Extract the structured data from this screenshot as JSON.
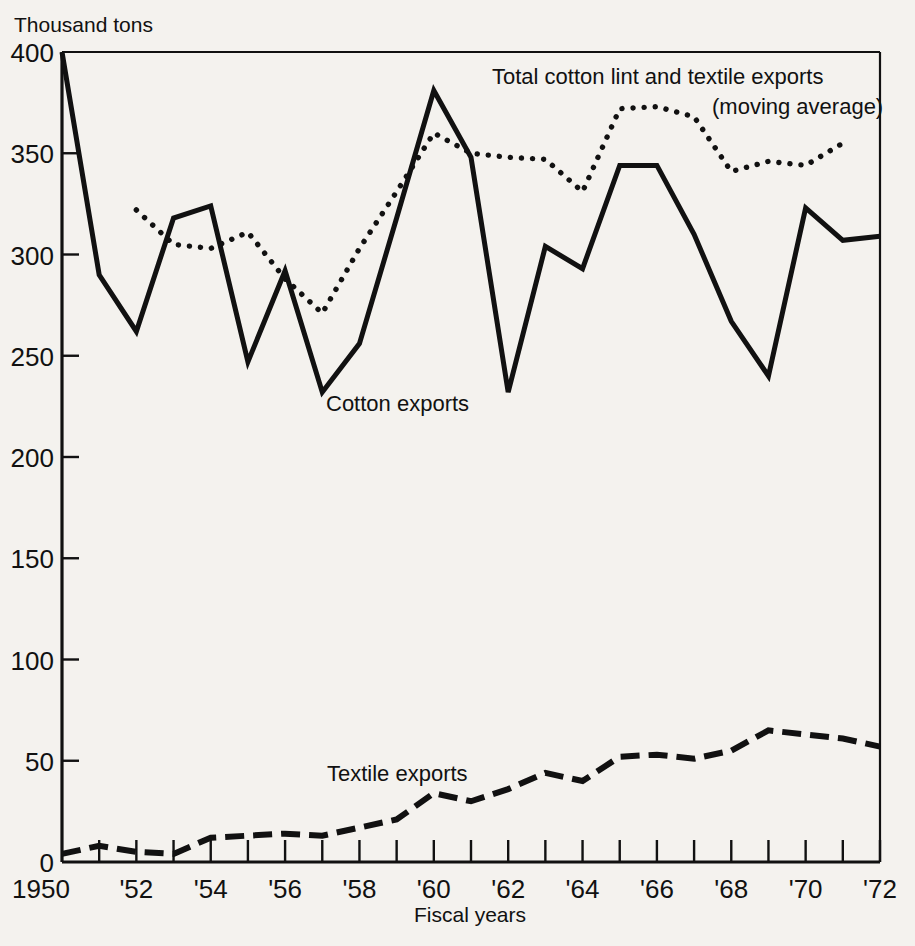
{
  "chart_data": {
    "type": "line",
    "title": "",
    "xlabel": "Fiscal years",
    "ylabel": "Thousand tons",
    "ylim": [
      0,
      400
    ],
    "xlim": [
      1950,
      1972
    ],
    "grid": false,
    "legend_position": "inline-annotations",
    "y_ticks": [
      0,
      50,
      100,
      150,
      200,
      250,
      300,
      350,
      400
    ],
    "y_tick_labels": [
      "0",
      "50",
      "100",
      "150",
      "200",
      "250",
      "300",
      "350",
      "400"
    ],
    "x_ticks": [
      1950,
      1951,
      1952,
      1953,
      1954,
      1955,
      1956,
      1957,
      1958,
      1959,
      1960,
      1961,
      1962,
      1963,
      1964,
      1965,
      1966,
      1967,
      1968,
      1969,
      1970,
      1971,
      1972
    ],
    "x_tick_labels": [
      "1950",
      "",
      "'52",
      "",
      "'54",
      "",
      "'56",
      "",
      "'58",
      "",
      "'60",
      "",
      "'62",
      "",
      "'64",
      "",
      "'66",
      "",
      "'68",
      "",
      "'70",
      "",
      "'72"
    ],
    "x": [
      1950,
      1951,
      1952,
      1953,
      1954,
      1955,
      1956,
      1957,
      1958,
      1959,
      1960,
      1961,
      1962,
      1963,
      1964,
      1965,
      1966,
      1967,
      1968,
      1969,
      1970,
      1971,
      1972
    ],
    "series": [
      {
        "name": "Cotton exports",
        "style": "solid",
        "values": [
          400,
          290,
          262,
          318,
          324,
          247,
          292,
          232,
          256,
          318,
          381,
          348,
          232,
          304,
          293,
          344,
          344,
          310,
          267,
          240,
          323,
          307,
          309
        ]
      },
      {
        "name": "Total cotton lint and textile exports (moving average)",
        "style": "dotted",
        "x": [
          1952,
          1953,
          1954,
          1955,
          1956,
          1957,
          1958,
          1959,
          1960,
          1961,
          1962,
          1963,
          1964,
          1965,
          1966,
          1967,
          1968,
          1969,
          1970,
          1971
        ],
        "values": [
          322,
          305,
          303,
          311,
          288,
          271,
          303,
          331,
          360,
          350,
          348,
          347,
          331,
          372,
          373,
          368,
          341,
          346,
          344,
          355
        ]
      },
      {
        "name": "Textile exports",
        "style": "dashed",
        "values": [
          4,
          8,
          5,
          4,
          12,
          13,
          14,
          13,
          17,
          21,
          34,
          30,
          36,
          44,
          40,
          52,
          53,
          51,
          55,
          65,
          63,
          61,
          57
        ]
      }
    ],
    "annotations": [
      {
        "id": "total-annotation",
        "lines": [
          "Total cotton lint and textile exports",
          "(moving average)"
        ],
        "target_series": "Total cotton lint and textile exports (moving average)"
      },
      {
        "id": "cotton-annotation",
        "lines": [
          "Cotton exports"
        ],
        "target_series": "Cotton exports"
      },
      {
        "id": "textile-annotation",
        "lines": [
          "Textile exports"
        ],
        "target_series": "Textile exports"
      }
    ],
    "colors": {
      "ink": "#111111",
      "paper": "#f4f2ee"
    }
  },
  "labels": {
    "y_axis_title": "Thousand tons",
    "x_axis_title": "Fiscal years",
    "annotation_total_line1": "Total cotton lint and textile exports",
    "annotation_total_line2": "(moving average)",
    "annotation_cotton": "Cotton exports",
    "annotation_textile": "Textile exports",
    "y_400": "400",
    "y_350": "350",
    "y_300": "300",
    "y_250": "250",
    "y_200": "200",
    "y_150": "150",
    "y_100": "100",
    "y_50": "50",
    "y_0": "0",
    "x_1950": "1950",
    "x_1952": "'52",
    "x_1954": "'54",
    "x_1956": "'56",
    "x_1958": "'58",
    "x_1960": "'60",
    "x_1962": "'62",
    "x_1964": "'64",
    "x_1966": "'66",
    "x_1968": "'68",
    "x_1970": "'70",
    "x_1972": "'72"
  }
}
